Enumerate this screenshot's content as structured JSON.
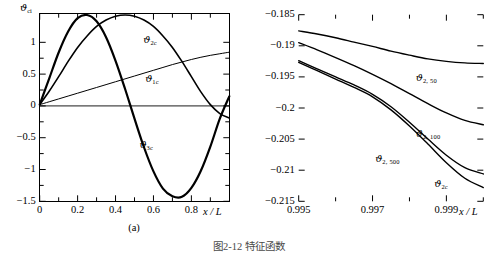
{
  "figure": {
    "caption": "图2-12 特征函数",
    "panels": [
      {
        "id": "a",
        "caption": "(a)"
      },
      {
        "id": "b",
        "caption": "(b)"
      }
    ]
  },
  "chart_data": [
    {
      "type": "line",
      "panel": "(a)",
      "title": "",
      "xlabel": "x / L",
      "ylabel": "ϑ",
      "ylabel_sub": "ci",
      "xlim": [
        0,
        1
      ],
      "ylim": [
        -1.5,
        1.45
      ],
      "grid": false,
      "legend_position": "inline-annotations",
      "xticks": [
        "0",
        "0.2",
        "0.4",
        "0.6",
        "0.8"
      ],
      "xtick_values": [
        0,
        0.2,
        0.4,
        0.6,
        0.8
      ],
      "yticks": [
        "1",
        "0.5",
        "0",
        "−0.5",
        "−1",
        "−1.5"
      ],
      "ytick_values": [
        1,
        0.5,
        0,
        -0.5,
        -1,
        -1.5
      ],
      "series": [
        {
          "name": "ϑ",
          "name_sub": "1c",
          "label_x": 0.63,
          "label_y": 0.42,
          "linewidth": 1.0,
          "color": "#000000",
          "x": [
            0,
            0.05,
            0.1,
            0.15,
            0.2,
            0.25,
            0.3,
            0.35,
            0.4,
            0.45,
            0.5,
            0.55,
            0.6,
            0.65,
            0.7,
            0.75,
            0.8,
            0.85,
            0.9,
            0.95,
            1.0
          ],
          "values": [
            0.02,
            0.065,
            0.11,
            0.155,
            0.2,
            0.245,
            0.29,
            0.335,
            0.38,
            0.425,
            0.47,
            0.515,
            0.56,
            0.605,
            0.65,
            0.69,
            0.73,
            0.765,
            0.795,
            0.82,
            0.845
          ]
        },
        {
          "name": "ϑ",
          "name_sub": "2c",
          "label_x": 0.62,
          "label_y": 1.03,
          "linewidth": 1.6,
          "color": "#000000",
          "x": [
            0,
            0.05,
            0.1,
            0.15,
            0.2,
            0.25,
            0.3,
            0.35,
            0.4,
            0.45,
            0.5,
            0.55,
            0.6,
            0.65,
            0.7,
            0.75,
            0.8,
            0.85,
            0.9,
            0.95,
            1.0
          ],
          "values": [
            0.02,
            0.23,
            0.46,
            0.7,
            0.92,
            1.1,
            1.25,
            1.35,
            1.41,
            1.43,
            1.41,
            1.35,
            1.25,
            1.1,
            0.92,
            0.7,
            0.46,
            0.22,
            0.02,
            -0.12,
            -0.19
          ]
        },
        {
          "name": "ϑ",
          "name_sub": "3c",
          "label_x": 0.6,
          "label_y": -0.62,
          "linewidth": 2.2,
          "color": "#000000",
          "x": [
            0,
            0.05,
            0.1,
            0.15,
            0.2,
            0.25,
            0.3,
            0.35,
            0.4,
            0.45,
            0.5,
            0.55,
            0.6,
            0.65,
            0.7,
            0.75,
            0.8,
            0.85,
            0.9,
            0.95,
            1.0
          ],
          "values": [
            0.02,
            0.43,
            0.84,
            1.17,
            1.38,
            1.43,
            1.33,
            1.08,
            0.71,
            0.27,
            -0.2,
            -0.65,
            -1.03,
            -1.3,
            -1.42,
            -1.43,
            -1.29,
            -1.02,
            -0.64,
            -0.2,
            0.15
          ]
        }
      ]
    },
    {
      "type": "line",
      "panel": "(b)",
      "title": "",
      "xlabel": "x / L",
      "ylabel": "",
      "xlim": [
        0.995,
        1.0
      ],
      "ylim": [
        -0.215,
        -0.185
      ],
      "grid": false,
      "legend_position": "inline-annotations",
      "xticks": [
        "0.995",
        "0.997",
        "0.999"
      ],
      "xtick_values": [
        0.995,
        0.997,
        0.999
      ],
      "yticks": [
        "−0.185",
        "−0.19",
        "−0.195",
        "−0.2",
        "−0.205",
        "−0.21",
        "−0.215"
      ],
      "ytick_values": [
        -0.185,
        -0.19,
        -0.195,
        -0.2,
        -0.205,
        -0.21,
        -0.215
      ],
      "series": [
        {
          "name": "ϑ",
          "name_sub": "2, 50",
          "label_x": 0.99855,
          "label_y": -0.1952,
          "linewidth": 1.4,
          "color": "#000000",
          "x": [
            0.995,
            0.9955,
            0.996,
            0.9965,
            0.997,
            0.9975,
            0.998,
            0.9985,
            0.999,
            0.9995,
            1.0
          ],
          "values": [
            -0.1876,
            -0.1881,
            -0.1887,
            -0.1894,
            -0.1901,
            -0.19085,
            -0.1915,
            -0.1921,
            -0.1925,
            -0.19275,
            -0.19285
          ]
        },
        {
          "name": "ϑ",
          "name_sub": "2, 100",
          "label_x": 0.99855,
          "label_y": -0.2042,
          "linewidth": 1.4,
          "color": "#000000",
          "x": [
            0.995,
            0.9955,
            0.996,
            0.9965,
            0.997,
            0.9975,
            0.998,
            0.9985,
            0.999,
            0.9995,
            1.0
          ],
          "values": [
            -0.1895,
            -0.19065,
            -0.1919,
            -0.1932,
            -0.1946,
            -0.1961,
            -0.1977,
            -0.1993,
            -0.2008,
            -0.202,
            -0.2027
          ]
        },
        {
          "name": "ϑ",
          "name_sub": "2, 500",
          "label_x": 0.99745,
          "label_y": -0.2082,
          "linewidth": 1.4,
          "color": "#000000",
          "x": [
            0.995,
            0.9955,
            0.996,
            0.9965,
            0.997,
            0.9975,
            0.998,
            0.9985,
            0.999,
            0.9995,
            1.0
          ],
          "values": [
            -0.1924,
            -0.1937,
            -0.195,
            -0.1963,
            -0.1978,
            -0.1998,
            -0.2023,
            -0.205,
            -0.2076,
            -0.2096,
            -0.2106
          ]
        },
        {
          "name": "ϑ",
          "name_sub": "2c",
          "label_x": 0.99905,
          "label_y": -0.2122,
          "linewidth": 1.4,
          "color": "#000000",
          "x": [
            0.995,
            0.9955,
            0.996,
            0.9965,
            0.997,
            0.9975,
            0.998,
            0.9985,
            0.999,
            0.9995,
            1.0
          ],
          "values": [
            -0.19265,
            -0.194,
            -0.19535,
            -0.1967,
            -0.1982,
            -0.2003,
            -0.2029,
            -0.2058,
            -0.2088,
            -0.2113,
            -0.2128
          ]
        }
      ]
    }
  ]
}
